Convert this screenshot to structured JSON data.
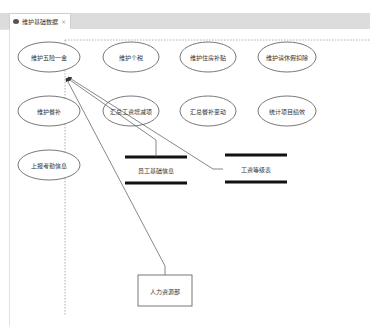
{
  "tab": {
    "title": "维护基础数据",
    "close_glyph": "⨯",
    "icon": "diagram-icon"
  },
  "diagram": {
    "processes": [
      {
        "id": "p1",
        "label": "维护五险一金",
        "cx": 49,
        "cy": 57
      },
      {
        "id": "p2",
        "label": "维护个税",
        "cx": 131,
        "cy": 57
      },
      {
        "id": "p3",
        "label": "维护住房补贴",
        "cx": 208,
        "cy": 57
      },
      {
        "id": "p4",
        "label": "维护请休假扣除",
        "cx": 287,
        "cy": 57
      },
      {
        "id": "p5",
        "label": "维护餐补",
        "cx": 49,
        "cy": 111
      },
      {
        "id": "p6",
        "label": "汇总工资增减项",
        "cx": 131,
        "cy": 111
      },
      {
        "id": "p7",
        "label": "汇总餐补变动",
        "cx": 208,
        "cy": 111
      },
      {
        "id": "p8",
        "label": "统计项目绩效",
        "cx": 287,
        "cy": 111
      },
      {
        "id": "p9",
        "label": "上报考勤信息",
        "cx": 49,
        "cy": 165
      }
    ],
    "data_stores": [
      {
        "id": "d1",
        "label": "员工基础信息",
        "x1": 125,
        "x2": 187,
        "cy": 170
      },
      {
        "id": "d2",
        "label": "工资等级表",
        "x1": 225,
        "x2": 287,
        "cy": 170
      }
    ],
    "external_entities": [
      {
        "id": "e1",
        "label": "人力资源部",
        "x": 138,
        "y": 275,
        "w": 54,
        "h": 31
      }
    ],
    "boundary": {
      "style": "dashed",
      "color": "#999999"
    },
    "flows": [
      {
        "from": "e1",
        "to": "p1"
      },
      {
        "from": "d1",
        "to": "p1"
      },
      {
        "from": "d2",
        "to": "p1"
      }
    ]
  }
}
